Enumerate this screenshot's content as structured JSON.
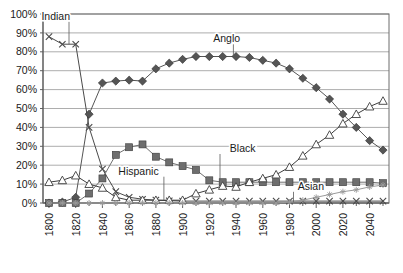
{
  "chart_data": {
    "type": "line",
    "title": "",
    "xlabel": "",
    "ylabel": "",
    "xlim": [
      1800,
      2050
    ],
    "ylim": [
      0,
      100
    ],
    "grid": true,
    "legend": "inline-annotations",
    "ytick_labels": [
      "0%",
      "10%",
      "20%",
      "30%",
      "40%",
      "50%",
      "60%",
      "70%",
      "80%",
      "90%",
      "100%"
    ],
    "ytick_values": [
      0,
      10,
      20,
      30,
      40,
      50,
      60,
      70,
      80,
      90,
      100
    ],
    "xtick_labels": [
      "1800",
      "1820",
      "1840",
      "1860",
      "1880",
      "1900",
      "1920",
      "1940",
      "1960",
      "1980",
      "2000",
      "2020",
      "2040"
    ],
    "xtick_values": [
      1800,
      1820,
      1840,
      1860,
      1880,
      1900,
      1920,
      1940,
      1960,
      1980,
      2000,
      2020,
      2040
    ],
    "x": [
      1800,
      1810,
      1820,
      1830,
      1840,
      1850,
      1860,
      1870,
      1880,
      1890,
      1900,
      1910,
      1920,
      1930,
      1940,
      1950,
      1960,
      1970,
      1980,
      1990,
      2000,
      2010,
      2020,
      2030,
      2040,
      2050
    ],
    "series": [
      {
        "name": "Indian",
        "marker": "x",
        "color": "#4a4a4a",
        "values": [
          88,
          84,
          84,
          40,
          18,
          6,
          3,
          2,
          1.5,
          1.2,
          1,
          1,
          1,
          1,
          1,
          1,
          1,
          1,
          1,
          1,
          1,
          1,
          1,
          1,
          1,
          1
        ]
      },
      {
        "name": "Anglo",
        "marker": "diamond",
        "color": "#555555",
        "values": [
          0,
          0.5,
          3,
          47,
          63.5,
          64.5,
          65,
          64.5,
          71,
          74,
          76,
          77.5,
          77.5,
          77.5,
          77.5,
          77,
          75.5,
          74,
          71,
          66,
          61,
          55,
          47,
          40,
          33,
          28
        ]
      },
      {
        "name": "Black",
        "marker": "square",
        "color": "#6e6e6e",
        "values": [
          0,
          0,
          0,
          5,
          13,
          25.5,
          29.5,
          31,
          24.5,
          21.5,
          19.5,
          17.5,
          12,
          11,
          11,
          11,
          11,
          11,
          11,
          11,
          11,
          11,
          11,
          11,
          11,
          10.5
        ]
      },
      {
        "name": "Hispanic",
        "marker": "triangle",
        "color": "#3d3d3d",
        "values": [
          11,
          12,
          14.5,
          10,
          8,
          3,
          1.5,
          1.5,
          1.5,
          1.5,
          1.5,
          5,
          7,
          9,
          8.5,
          11,
          13,
          15,
          19,
          25,
          31,
          36,
          42,
          47,
          51,
          54
        ]
      },
      {
        "name": "Asian",
        "marker": "plus",
        "color": "#9a9a9a",
        "values": [
          0,
          0,
          0,
          0,
          0,
          0,
          0,
          0,
          0,
          0,
          0,
          0,
          0,
          0,
          0,
          0,
          0,
          0,
          0.5,
          1.5,
          3,
          4.5,
          6,
          7,
          8.5,
          9.5
        ]
      }
    ],
    "annotations": [
      {
        "label": "Indian",
        "x": 1805,
        "y": 97,
        "leader_to_x": 1815,
        "leader_to_y": 84
      },
      {
        "label": "Anglo",
        "x": 1933,
        "y": 85,
        "leader_to_x": 1938,
        "leader_to_y": 77.5
      },
      {
        "label": "Black",
        "x": 1945,
        "y": 27,
        "leader_to_x": 1928,
        "leader_to_y": 12
      },
      {
        "label": "Hispanic",
        "x": 1867,
        "y": 15,
        "leader_to_x": 1886,
        "leader_to_y": 1.5
      },
      {
        "label": "Asian",
        "x": 1996,
        "y": 7,
        "leader_to_x": 1983,
        "leader_to_y": 0.6
      }
    ]
  }
}
